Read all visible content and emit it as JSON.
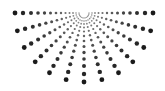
{
  "graphic": {
    "name": "half-sunburst-dot-pattern",
    "background": "#ffffff",
    "dot_color": "#1a1a1a",
    "center": [
      84,
      13
    ],
    "ray_count": 13,
    "start_angle_deg": 0,
    "end_angle_deg": 180,
    "radii": [
      5,
      8,
      11,
      14.5,
      18.5,
      23,
      28,
      33.5,
      39.5,
      46,
      53,
      61,
      69
    ],
    "dot_sizes": [
      0.7,
      0.8,
      0.9,
      1.0,
      1.1,
      1.2,
      1.35,
      1.5,
      1.65,
      1.8,
      2.0,
      2.2,
      2.4
    ]
  }
}
